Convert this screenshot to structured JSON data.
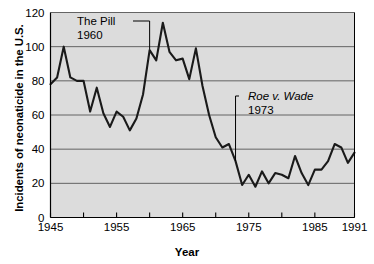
{
  "chart_data": {
    "type": "line",
    "title": "",
    "xlabel": "Year",
    "ylabel": "Incidents of neonaticide in the U.S.",
    "xlim": [
      1945,
      1991
    ],
    "ylim": [
      0,
      120
    ],
    "ytick_values": [
      0,
      20,
      40,
      60,
      80,
      100,
      120
    ],
    "ytick_labels": [
      "0",
      "20",
      "40",
      "60",
      "80",
      "100",
      "120"
    ],
    "xtick_values": [
      1945,
      1950,
      1955,
      1960,
      1965,
      1970,
      1975,
      1980,
      1985,
      1990,
      1991
    ],
    "xtick_labels": [
      "1945",
      "",
      "1955",
      "",
      "1965",
      "",
      "1975",
      "",
      "1985",
      "",
      "1991"
    ],
    "grid": "horizontal",
    "legend": "none",
    "plot_background": "#dcdcdc",
    "line_color": "#1a1a1a",
    "x": [
      1945,
      1946,
      1947,
      1948,
      1949,
      1950,
      1951,
      1952,
      1953,
      1954,
      1955,
      1956,
      1957,
      1958,
      1959,
      1960,
      1961,
      1962,
      1963,
      1964,
      1965,
      1966,
      1967,
      1968,
      1969,
      1970,
      1971,
      1972,
      1973,
      1974,
      1975,
      1976,
      1977,
      1978,
      1979,
      1980,
      1981,
      1982,
      1983,
      1984,
      1985,
      1986,
      1987,
      1988,
      1989,
      1990,
      1991
    ],
    "values": [
      78,
      82,
      100,
      82,
      80,
      80,
      62,
      76,
      61,
      53,
      62,
      59,
      51,
      58,
      72,
      98,
      92,
      114,
      97,
      92,
      93,
      81,
      99,
      77,
      60,
      47,
      41,
      43,
      33,
      19,
      25,
      18,
      27,
      20,
      26,
      25,
      23,
      36,
      26,
      19,
      28,
      28,
      33,
      43,
      41,
      32,
      38
    ],
    "annotations": [
      {
        "label_line1": "The Pill",
        "label_line2": "1960",
        "label_style": "regular",
        "points_to_year": 1960
      },
      {
        "label_line1": "Roe v. Wade",
        "label_line2": "1973",
        "label_style": "italic",
        "points_to_year": 1973
      }
    ]
  },
  "axes": {
    "y_title": "Incidents of neonaticide in the U.S.",
    "x_title": "Year"
  },
  "annotations": {
    "pill": {
      "line1": "The Pill",
      "line2": "1960"
    },
    "roe": {
      "line1": "Roe v. Wade",
      "line2": "1973"
    }
  }
}
